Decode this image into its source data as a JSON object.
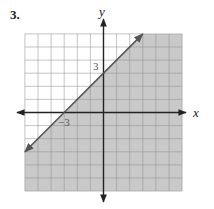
{
  "problem": {
    "number_label": "3."
  },
  "chart_data": {
    "type": "line",
    "title": "",
    "xlabel": "x",
    "ylabel": "y",
    "xlim": [
      -6,
      6
    ],
    "ylim": [
      -6,
      6
    ],
    "grid": true,
    "grid_step": 1,
    "boundary_line": {
      "slope": 1,
      "intercept": 3,
      "style": "solid",
      "points": [
        [
          -6,
          -3
        ],
        [
          3,
          6
        ]
      ]
    },
    "shaded_region": "below",
    "inequality": "y <= x + 3",
    "annotations": [
      {
        "text": "3",
        "x": -0.4,
        "y": 3.3
      },
      {
        "text": "−3",
        "x": -2.6,
        "y": -0.6
      }
    ]
  },
  "labels": {
    "x_axis": "x",
    "y_axis": "y",
    "y_intercept": "3",
    "x_intercept": "−3"
  },
  "colors": {
    "shade": "#c9c9c9",
    "grid_light": "#b5b5b5",
    "grid_dark": "#8f8f8f",
    "axis": "#222222",
    "line": "#555555"
  }
}
